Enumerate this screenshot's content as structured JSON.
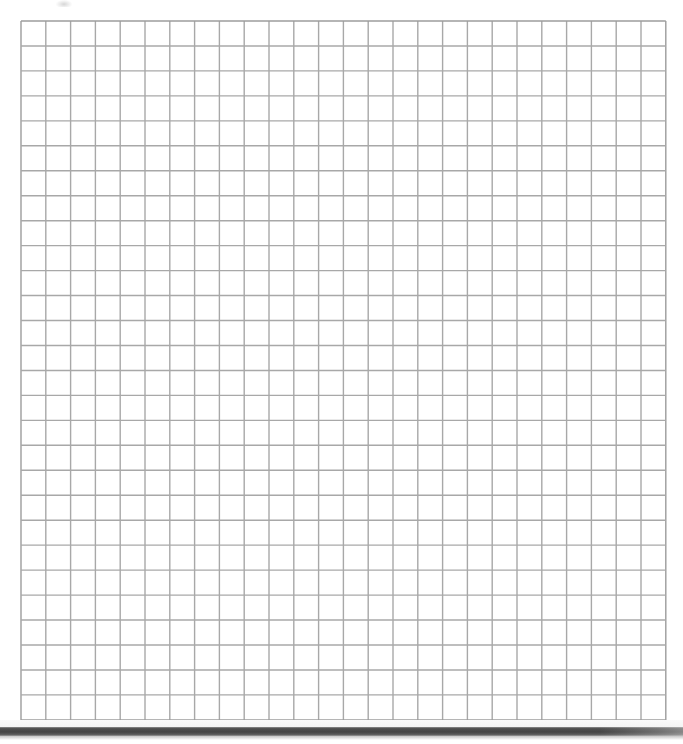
{
  "page": {
    "background_color": "#ffffff",
    "width": 683,
    "height": 744
  },
  "grid": {
    "label": "graph-paper-grid",
    "columns": 26,
    "rows": 28,
    "cell_width": 24.8,
    "cell_height": 24.96,
    "origin_x": 20,
    "origin_y": 20,
    "width": 645,
    "height": 699,
    "line_color": "#a8a8a8",
    "line_color_outer": "#9c9c9c",
    "line_width": 1.4,
    "fill_color": "#ffffff"
  },
  "artifacts": {
    "top_smudge": {
      "label": "faint-scan-smudge",
      "x": 56,
      "y": 0,
      "width": 16,
      "height": 7,
      "color": "#8c8c8c"
    },
    "bottom_bar": {
      "label": "scan-edge-shadow-bar",
      "x": 0,
      "y": 727,
      "width": 683,
      "height": 9,
      "color": "#454545"
    }
  }
}
